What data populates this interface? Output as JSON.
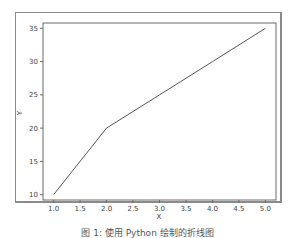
{
  "chart_data": {
    "type": "line",
    "title": "",
    "xlabel": "X",
    "ylabel": "Y",
    "x": [
      1,
      2,
      3,
      4,
      5
    ],
    "series": [
      {
        "name": "line",
        "values": [
          10,
          20,
          25,
          30,
          35
        ],
        "color": "#555555"
      }
    ],
    "xticks": [
      "1.0",
      "1.5",
      "2.0",
      "2.5",
      "3.0",
      "3.5",
      "4.0",
      "4.5",
      "5.0"
    ],
    "yticks": [
      "10",
      "15",
      "20",
      "25",
      "30",
      "35"
    ],
    "xlim": [
      0.8,
      5.2
    ],
    "ylim": [
      9.2,
      35.8
    ],
    "grid": false,
    "legend": null
  },
  "caption": "图 1: 使用 Python 绘制的折线图"
}
